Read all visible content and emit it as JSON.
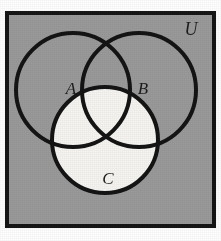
{
  "figure": {
    "type": "venn-diagram",
    "universe_label": "U",
    "set_labels": [
      "A",
      "B",
      "C"
    ],
    "shaded_region_description": "Circle C is shaded light (white); the universal set rectangle and circles A and B are shaded gray."
  },
  "colors": {
    "background": "#ffffff",
    "universe_fill": "#9a9a9a",
    "frame_stroke": "#161616",
    "circle_stroke": "#141414",
    "highlight_fill": "#f6f5f2",
    "label_color": "#1d1d1d"
  },
  "frame": {
    "x": 5,
    "y": 11,
    "width": 211,
    "height": 217,
    "stroke_width": 4
  },
  "circles": [
    {
      "id": "circle-a",
      "label": "A",
      "cx": 73,
      "cy": 90,
      "r": 57,
      "filled": false
    },
    {
      "id": "circle-b",
      "label": "B",
      "cx": 139,
      "cy": 90,
      "r": 57,
      "filled": false
    },
    {
      "id": "circle-c",
      "label": "C",
      "cx": 105,
      "cy": 140,
      "r": 53,
      "filled": true
    }
  ],
  "labels": {
    "universe": {
      "text": "U",
      "x": 191,
      "y": 35,
      "size": 18
    },
    "a": {
      "text": "A",
      "x": 71,
      "y": 94,
      "size": 17
    },
    "b": {
      "text": "B",
      "x": 143,
      "y": 94,
      "size": 17
    },
    "c": {
      "text": "C",
      "x": 108,
      "y": 184,
      "size": 17
    }
  }
}
